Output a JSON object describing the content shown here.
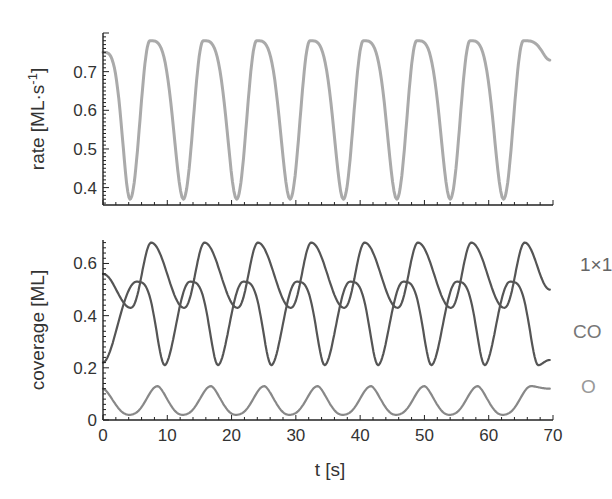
{
  "chart_data": [
    {
      "type": "line",
      "panel": "top",
      "title": "",
      "xlabel": "",
      "ylabel": "rate  [ML·s⁻¹]",
      "xlim": [
        0,
        70
      ],
      "ylim": [
        0.355,
        0.8
      ],
      "yticks": [
        0.4,
        0.5,
        0.6,
        0.7
      ],
      "ytick_labels": [
        "0.4",
        "0.5",
        "0.6",
        "0.7"
      ],
      "grid": false,
      "period_s": 8.3,
      "series": [
        {
          "name": "rate",
          "color": "#aaaaaa",
          "keypoints": {
            "t": [
              0,
              4.2,
              7.3,
              12.5,
              15.6,
              20.8,
              23.9,
              29.1,
              32.2,
              37.4,
              40.5,
              45.7,
              48.8,
              54.0,
              57.1,
              62.3,
              65.4,
              69.5
            ],
            "rate": [
              0.75,
              0.37,
              0.78,
              0.37,
              0.78,
              0.37,
              0.78,
              0.37,
              0.78,
              0.37,
              0.78,
              0.37,
              0.78,
              0.37,
              0.78,
              0.37,
              0.78,
              0.73
            ]
          }
        }
      ]
    },
    {
      "type": "line",
      "panel": "bottom",
      "title": "",
      "xlabel": "t  [s]",
      "ylabel": "coverage  [ML]",
      "xlim": [
        0,
        70
      ],
      "ylim": [
        0,
        0.69
      ],
      "xticks": [
        0,
        10,
        20,
        30,
        40,
        50,
        60,
        70
      ],
      "xtick_labels": [
        "0",
        "10",
        "20",
        "30",
        "40",
        "50",
        "60",
        "70"
      ],
      "yticks": [
        0,
        0.2,
        0.4,
        0.6
      ],
      "ytick_labels": [
        "0",
        "0.2",
        "0.4",
        "0.6"
      ],
      "grid": false,
      "legend": "inline labels at right",
      "period_s": 8.3,
      "series": [
        {
          "name": "1×1",
          "color": "#555555",
          "keypoints": {
            "t": [
              0,
              4.3,
              7.5,
              12.6,
              15.8,
              20.9,
              24.1,
              29.2,
              32.4,
              37.5,
              40.7,
              45.8,
              49.0,
              54.1,
              57.3,
              62.4,
              65.6,
              69.5
            ],
            "coverage": [
              0.56,
              0.43,
              0.68,
              0.43,
              0.68,
              0.43,
              0.68,
              0.43,
              0.68,
              0.43,
              0.68,
              0.43,
              0.68,
              0.43,
              0.68,
              0.43,
              0.68,
              0.5
            ]
          }
        },
        {
          "name": "CO",
          "color": "#555555",
          "keypoints": {
            "t": [
              0,
              5.2,
              9.6,
              13.5,
              17.9,
              21.8,
              26.2,
              30.1,
              34.5,
              38.4,
              42.8,
              46.7,
              51.1,
              55.0,
              59.4,
              63.3,
              67.7,
              69.5
            ],
            "coverage": [
              0.22,
              0.53,
              0.21,
              0.53,
              0.21,
              0.53,
              0.21,
              0.53,
              0.21,
              0.53,
              0.21,
              0.53,
              0.21,
              0.53,
              0.21,
              0.53,
              0.21,
              0.23
            ]
          }
        },
        {
          "name": "O",
          "color": "#888888",
          "keypoints": {
            "t": [
              0,
              4.0,
              8.5,
              12.3,
              16.8,
              20.6,
              25.1,
              28.9,
              33.4,
              37.2,
              41.7,
              45.5,
              50.0,
              53.8,
              58.3,
              62.1,
              66.6,
              69.5
            ],
            "coverage": [
              0.12,
              0.02,
              0.13,
              0.02,
              0.13,
              0.02,
              0.13,
              0.02,
              0.13,
              0.02,
              0.13,
              0.02,
              0.13,
              0.02,
              0.13,
              0.02,
              0.13,
              0.12
            ]
          }
        }
      ]
    }
  ],
  "labels": {
    "top_ylabel": "rate  [ML·s",
    "top_ylabel_sup": "-1",
    "top_ylabel_end": "]",
    "bottom_ylabel": "coverage  [ML]",
    "xlabel": "t  [s]",
    "series_1x1": "1×1",
    "series_co": "CO",
    "series_o": "O"
  }
}
